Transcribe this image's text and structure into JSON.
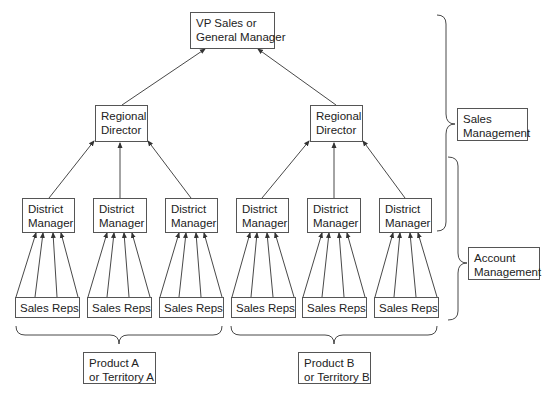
{
  "top": {
    "line1": "VP Sales or",
    "line2": "General Manager"
  },
  "regional": [
    {
      "line1": "Regional",
      "line2": "Director"
    },
    {
      "line1": "Regional",
      "line2": "Director"
    }
  ],
  "district": [
    {
      "line1": "District",
      "line2": "Manager"
    },
    {
      "line1": "District",
      "line2": "Manager"
    },
    {
      "line1": "District",
      "line2": "Manager"
    },
    {
      "line1": "District",
      "line2": "Manager"
    },
    {
      "line1": "District",
      "line2": "Manager"
    },
    {
      "line1": "District",
      "line2": "Manager"
    }
  ],
  "reps": [
    "Sales Reps",
    "Sales Reps",
    "Sales Reps",
    "Sales Reps",
    "Sales Reps",
    "Sales Reps"
  ],
  "brackets": {
    "sales_management": {
      "line1": "Sales",
      "line2": "Management"
    },
    "account_management": {
      "line1": "Account",
      "line2": "Management"
    },
    "product_a": {
      "line1": "Product A",
      "line2": "or Territory A"
    },
    "product_b": {
      "line1": "Product B",
      "line2": "or Territory B"
    }
  },
  "colors": {
    "line": "#333333",
    "border": "#555555"
  }
}
